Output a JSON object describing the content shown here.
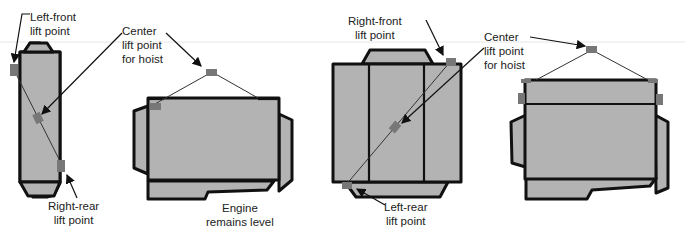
{
  "diagram": {
    "colors": {
      "engine_fill": "#b3b3b3",
      "outline": "#111111",
      "lift_point": "#777777",
      "background": "#ffffff"
    },
    "panels": [
      {
        "view": "top view, diagonal lift",
        "labels": {
          "left_front": [
            "Left-front",
            "lift point"
          ],
          "center": [
            "Center",
            "lift point",
            "for hoist"
          ],
          "right_rear": [
            "Right-rear",
            "lift point"
          ]
        }
      },
      {
        "view": "side view, engine level",
        "labels": {
          "result": [
            "Engine",
            "remains level"
          ]
        }
      },
      {
        "view": "top view, diagonal lift",
        "labels": {
          "right_front": [
            "Right-front",
            "lift point"
          ],
          "center": [
            "Center",
            "lift point",
            "for hoist"
          ],
          "left_rear": [
            "Left-rear",
            "lift point"
          ]
        }
      },
      {
        "view": "end view, engine level",
        "labels": {}
      }
    ]
  }
}
